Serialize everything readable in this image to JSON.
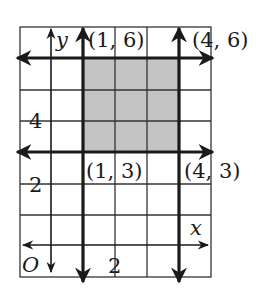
{
  "diagram": {
    "type": "coordinate-grid",
    "axes": {
      "x_label": "x",
      "y_label": "y",
      "origin_label": "O"
    },
    "tick_labels": {
      "x": [
        "2"
      ],
      "y": [
        "2",
        "4"
      ]
    },
    "points": [
      {
        "label": "(1, 6)",
        "x": 1,
        "y": 6
      },
      {
        "label": "(4, 6)",
        "x": 4,
        "y": 6
      },
      {
        "label": "(1, 3)",
        "x": 1,
        "y": 3
      },
      {
        "label": "(4, 3)",
        "x": 4,
        "y": 3
      }
    ],
    "shaded_region": {
      "x_min": 1,
      "x_max": 4,
      "y_min": 3,
      "y_max": 6
    },
    "boundary_lines": [
      "x = 1",
      "x = 4",
      "y = 3",
      "y = 6"
    ],
    "grid": {
      "x_range": [
        -1,
        5
      ],
      "y_range": [
        -1,
        7
      ]
    },
    "colors": {
      "shade": "#c4c4c4",
      "lines": "#1a1a1a",
      "grid": "#333333"
    }
  }
}
